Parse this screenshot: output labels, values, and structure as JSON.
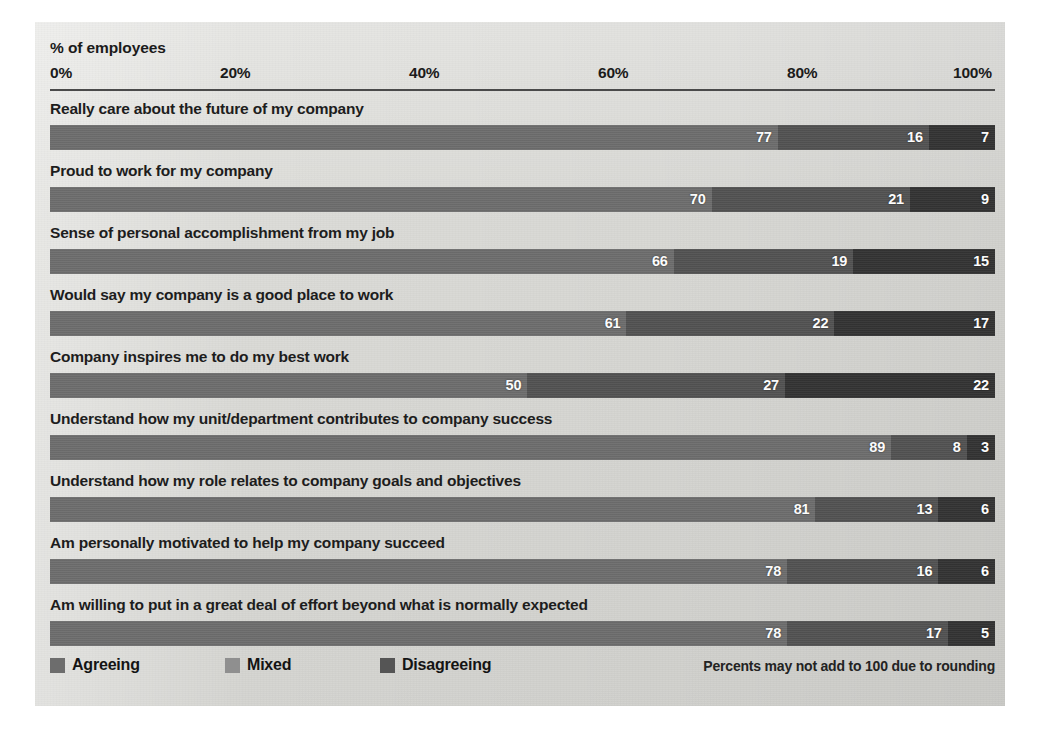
{
  "chart_data": {
    "type": "bar",
    "subtype": "stacked-horizontal-100",
    "title": "",
    "xlabel": "% of employees",
    "ylabel": "",
    "xlim": [
      0,
      100
    ],
    "grid": false,
    "legend_position": "bottom-left",
    "tick_labels": [
      "0%",
      "20%",
      "40%",
      "60%",
      "80%",
      "100%"
    ],
    "tick_values": [
      0,
      20,
      40,
      60,
      80,
      100
    ],
    "categories": [
      "Really care about the future of my company",
      "Proud to work for my company",
      "Sense of personal accomplishment from my job",
      "Would say my company is a good place to work",
      "Company inspires me to do my best work",
      "Understand how my unit/department contributes to company success",
      "Understand how my role relates to company goals and objectives",
      "Am personally motivated to help my company succeed",
      "Am willing to put in a great deal of effort beyond what is normally expected"
    ],
    "series": [
      {
        "name": "Agreeing",
        "color": "#6d6d6d",
        "values": [
          77,
          70,
          66,
          61,
          50,
          89,
          81,
          78,
          78
        ]
      },
      {
        "name": "Mixed",
        "color": "#8f8f8f",
        "values": [
          16,
          21,
          19,
          22,
          27,
          8,
          13,
          16,
          17
        ]
      },
      {
        "name": "Disagreeing",
        "color": "#555555",
        "values": [
          7,
          9,
          15,
          17,
          22,
          3,
          6,
          6,
          5
        ]
      }
    ],
    "annotations": [
      "Percents may not add to 100 due to rounding"
    ]
  },
  "header": {
    "axis_title": "% of employees"
  },
  "legend": {
    "items": [
      {
        "label": "Agreeing"
      },
      {
        "label": "Mixed"
      },
      {
        "label": "Disagreeing"
      }
    ]
  },
  "footnote": "Percents may not add to 100 due to rounding"
}
